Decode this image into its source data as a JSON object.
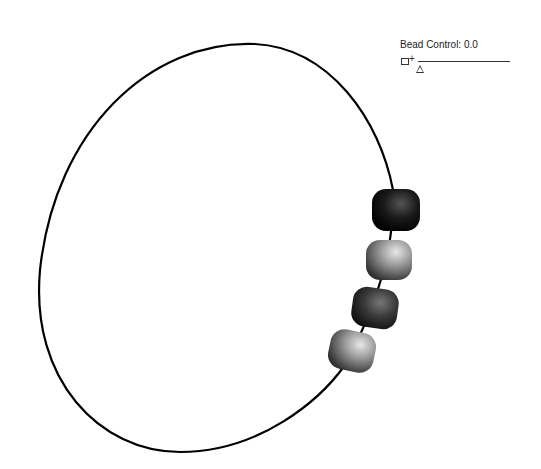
{
  "control": {
    "label": "Bead Control: 0.0",
    "value": 0.0
  },
  "scene": {
    "loop_color": "#000000",
    "beads": [
      {
        "name": "bead-1",
        "shade": "dark",
        "color": "#1a1a1a"
      },
      {
        "name": "bead-2",
        "shade": "light",
        "color": "#8a8a8a"
      },
      {
        "name": "bead-3",
        "shade": "dark",
        "color": "#3a3a3a"
      },
      {
        "name": "bead-4",
        "shade": "light",
        "color": "#7a7a7a"
      }
    ]
  }
}
